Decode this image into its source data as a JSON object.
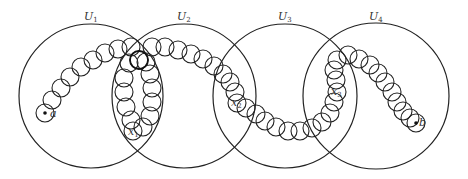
{
  "diagram": {
    "sets": [
      {
        "label": "U",
        "sub": "1",
        "cx": 91,
        "cy": 96,
        "r": 72,
        "label_x": 84,
        "label_y": 20
      },
      {
        "label": "U",
        "sub": "2",
        "cx": 184,
        "cy": 96,
        "r": 72,
        "label_x": 177,
        "label_y": 20
      },
      {
        "label": "U",
        "sub": "3",
        "cx": 285,
        "cy": 96,
        "r": 72,
        "label_x": 278,
        "label_y": 20
      },
      {
        "label": "U",
        "sub": "4",
        "cx": 376,
        "cy": 96,
        "r": 73,
        "label_x": 369,
        "label_y": 20
      }
    ],
    "points": [
      {
        "label": "a",
        "x": 45,
        "y": 113,
        "dot": true,
        "label_dx": 5,
        "label_dy": 4
      },
      {
        "label": "b",
        "x": 416,
        "y": 123,
        "dot": true,
        "label_dx": 3,
        "label_dy": 3
      },
      {
        "label": "x",
        "sub": "1",
        "x": 133,
        "y": 131,
        "dot": false,
        "label_dx": -5,
        "label_dy": 4
      },
      {
        "label": "x",
        "sub": "2",
        "x": 237,
        "y": 103,
        "dot": false,
        "label_dx": -6,
        "label_dy": 3
      },
      {
        "label": "x",
        "sub": "3",
        "x": 337,
        "y": 92,
        "dot": false,
        "label_dx": -6,
        "label_dy": 3
      }
    ],
    "small_radius": 9,
    "chain": [
      [
        45,
        113
      ],
      [
        52,
        100
      ],
      [
        61,
        88
      ],
      [
        70,
        77
      ],
      [
        81,
        67
      ],
      [
        93,
        60
      ],
      [
        105,
        53
      ],
      [
        118,
        49
      ],
      [
        131,
        47
      ],
      [
        139,
        60
      ],
      [
        129,
        63
      ],
      [
        124,
        78
      ],
      [
        124,
        92
      ],
      [
        126,
        107
      ],
      [
        131,
        120
      ],
      [
        133,
        131
      ],
      [
        143,
        127
      ],
      [
        150,
        116
      ],
      [
        152,
        102
      ],
      [
        152,
        88
      ],
      [
        150,
        74
      ],
      [
        146,
        62
      ],
      [
        152,
        47
      ],
      [
        165,
        47
      ],
      [
        178,
        50
      ],
      [
        191,
        54
      ],
      [
        203,
        59
      ],
      [
        214,
        66
      ],
      [
        223,
        74
      ],
      [
        230,
        82
      ],
      [
        235,
        92
      ],
      [
        237,
        103
      ],
      [
        246,
        108
      ],
      [
        256,
        114
      ],
      [
        265,
        121
      ],
      [
        276,
        127
      ],
      [
        288,
        131
      ],
      [
        300,
        131
      ],
      [
        312,
        128
      ],
      [
        322,
        122
      ],
      [
        330,
        113
      ],
      [
        334,
        102
      ],
      [
        337,
        92
      ],
      [
        336,
        80
      ],
      [
        334,
        70
      ],
      [
        337,
        60
      ],
      [
        348,
        55
      ],
      [
        359,
        59
      ],
      [
        370,
        65
      ],
      [
        378,
        73
      ],
      [
        385,
        82
      ],
      [
        392,
        92
      ],
      [
        397,
        102
      ],
      [
        403,
        111
      ],
      [
        410,
        118
      ],
      [
        416,
        123
      ]
    ],
    "bold_circle": [
      139,
      60
    ]
  }
}
